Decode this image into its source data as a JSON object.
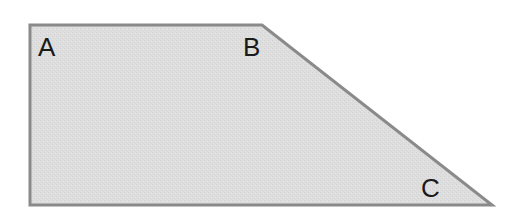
{
  "diagram": {
    "type": "trapezoid",
    "fill_color": "#dcdcdc",
    "stroke_color": "#8a8a8a",
    "stroke_width": 3,
    "vertices": [
      {
        "label": "A",
        "x": 30,
        "y": 25
      },
      {
        "label": "B",
        "x": 262,
        "y": 25
      },
      {
        "label": "C",
        "x": 492,
        "y": 205
      },
      {
        "label": "",
        "x": 30,
        "y": 205
      }
    ],
    "labels": [
      {
        "text": "A",
        "x": 38,
        "y": 56
      },
      {
        "text": "B",
        "x": 243,
        "y": 56
      },
      {
        "text": "C",
        "x": 421,
        "y": 197
      }
    ]
  }
}
